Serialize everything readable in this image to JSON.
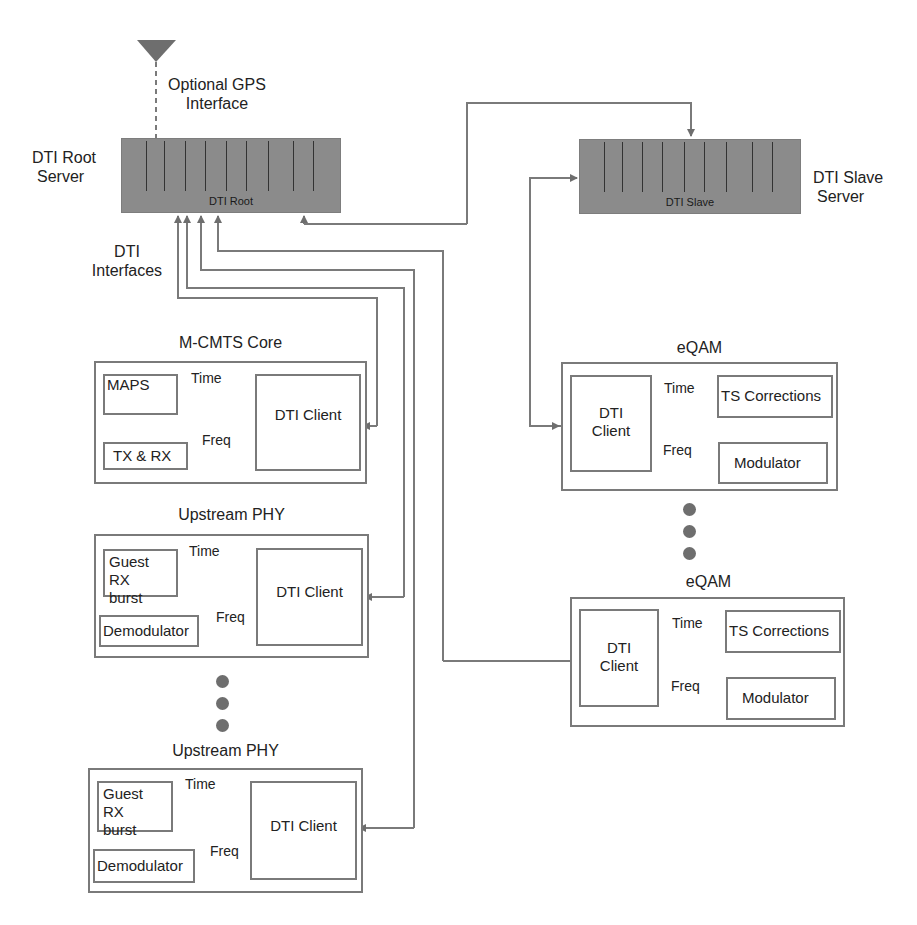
{
  "gps": {
    "label_line1": "Optional GPS",
    "label_line2": "Interface"
  },
  "root_server": {
    "label_line1": "DTI Root",
    "label_line2": "Server",
    "inner_label": "DTI Root"
  },
  "slave_server": {
    "label_line1": "DTI Slave",
    "label_line2": "Server",
    "inner_label": "DTI Slave"
  },
  "interfaces": {
    "label_line1": "DTI",
    "label_line2": "Interfaces"
  },
  "mcmts": {
    "title": "M-CMTS Core",
    "blocks": {
      "maps": "MAPS",
      "txrx": "TX & RX",
      "client": "DTI Client"
    },
    "arrows": {
      "time": "Time",
      "freq": "Freq"
    }
  },
  "upstream_phy_1": {
    "title": "Upstream PHY",
    "blocks": {
      "guest_line1": "Guest RX",
      "guest_line2": "burst",
      "demod": "Demodulator",
      "client": "DTI Client"
    },
    "arrows": {
      "time": "Time",
      "freq": "Freq"
    }
  },
  "upstream_phy_2": {
    "title": "Upstream PHY",
    "blocks": {
      "guest_line1": "Guest RX",
      "guest_line2": "burst",
      "demod": "Demodulator",
      "client": "DTI Client"
    },
    "arrows": {
      "time": "Time",
      "freq": "Freq"
    }
  },
  "eqam_1": {
    "title": "eQAM",
    "blocks": {
      "client_line1": "DTI",
      "client_line2": "Client",
      "ts": "TS Corrections",
      "mod": "Modulator"
    },
    "arrows": {
      "time": "Time",
      "freq": "Freq"
    }
  },
  "eqam_2": {
    "title": "eQAM",
    "blocks": {
      "client_line1": "DTI",
      "client_line2": "Client",
      "ts": "TS Corrections",
      "mod": "Modulator"
    },
    "arrows": {
      "time": "Time",
      "freq": "Freq"
    }
  },
  "colors": {
    "server_fill": "#8b8b8b",
    "line": "#7a7a7a",
    "dot": "#6e6e6e"
  }
}
